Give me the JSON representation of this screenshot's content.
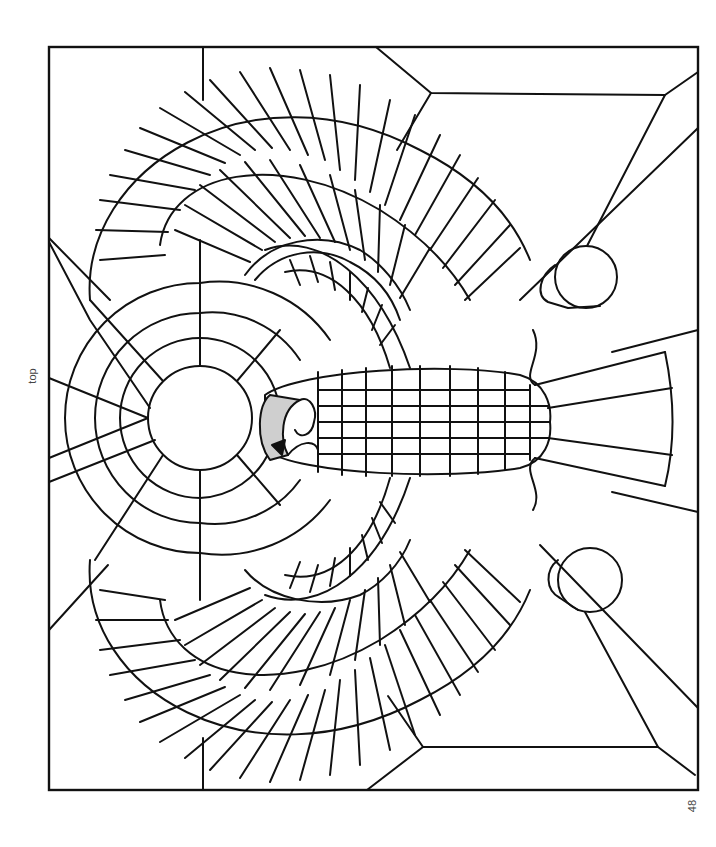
{
  "page": {
    "orientation_label": "top",
    "page_number": "48"
  },
  "colors": {
    "line": "#111111",
    "background": "#ffffff",
    "shade": "#cfcfcf"
  },
  "frame": {
    "x": 49,
    "y": 47,
    "width": 649,
    "height": 743
  },
  "sun": {
    "cx": 200,
    "cy": 418,
    "r": 52
  },
  "orbs": [
    {
      "name": "upper-orb",
      "cx": 586,
      "cy": 277,
      "r": 31
    },
    {
      "name": "lower-orb",
      "cx": 590,
      "cy": 580,
      "r": 32
    }
  ],
  "body": {
    "cx": 410,
    "cy": 422,
    "rx": 145,
    "ry": 55
  }
}
